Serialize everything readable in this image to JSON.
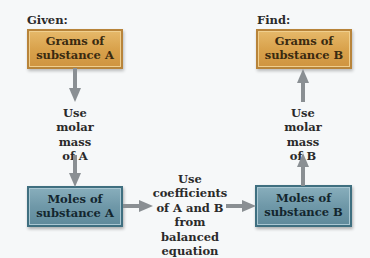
{
  "given_label": "Given:",
  "find_label": "Find:",
  "boxes": {
    "grams_a": {
      "line1": "Grams of",
      "line2": "substance A"
    },
    "grams_b": {
      "line1": "Grams of",
      "line2": "substance B"
    },
    "moles_a": {
      "line1": "Moles of",
      "line2": "substance A"
    },
    "moles_b": {
      "line1": "Moles of",
      "line2": "substance B"
    }
  },
  "notes": {
    "left": [
      "Use",
      "molar mass",
      "of A"
    ],
    "right": [
      "Use",
      "molar mass",
      "of B"
    ],
    "middle": [
      "Use",
      "coefficients",
      "of A and B",
      "from",
      "balanced equation"
    ]
  },
  "colors": {
    "gold_box": "#d9a24c",
    "teal_box": "#6f98a8",
    "arrow": "#8a8f93",
    "background": "#f6f8f9"
  }
}
